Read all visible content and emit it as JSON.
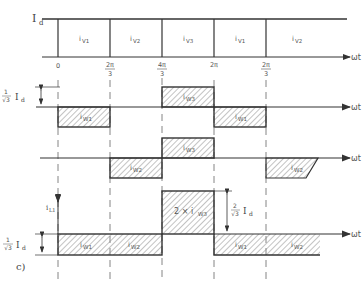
{
  "figure_label": "c)",
  "colors": {
    "line": "#333333",
    "hatch": "#777777",
    "dash": "#666666",
    "text": "#444444"
  },
  "top_plot": {
    "y_label_main": "I",
    "y_label_sub": "d",
    "axis_label": "ωt",
    "segments": [
      {
        "name": "v1",
        "label": "i",
        "sub": "V1"
      },
      {
        "name": "v2",
        "label": "i",
        "sub": "V2"
      },
      {
        "name": "v3",
        "label": "i",
        "sub": "V3"
      },
      {
        "name": "v1b",
        "label": "i",
        "sub": "V1"
      },
      {
        "name": "v2b",
        "label": "i",
        "sub": "V2"
      }
    ],
    "ticks": [
      {
        "num": "0",
        "den": ""
      },
      {
        "num": "2π",
        "den": "3"
      },
      {
        "num": "4π",
        "den": "3"
      },
      {
        "num": "2π",
        "den": ""
      },
      {
        "num": "2π",
        "den": "3"
      }
    ]
  },
  "plot_w1": {
    "axis_label": "ωt",
    "amp_num": "1",
    "amp_den": "√3",
    "amp_unit": "I",
    "amp_sub": "d",
    "blocks": [
      {
        "label": "i",
        "sub": "W1"
      },
      {
        "label": "i",
        "sub": "W3"
      },
      {
        "label": "i",
        "sub": "W1"
      }
    ]
  },
  "plot_w2": {
    "axis_label": "ωt",
    "blocks": [
      {
        "label": "i",
        "sub": "W3"
      },
      {
        "label": "i",
        "sub": "W2"
      },
      {
        "label": "i",
        "sub": "W2"
      }
    ]
  },
  "plot_l1": {
    "y_label_main": "i",
    "y_label_sub": "L1",
    "axis_label": "ωt",
    "amp_num": "1",
    "amp_den": "√3",
    "amp_unit": "I",
    "amp_sub": "d",
    "peak_num": "2",
    "peak_den": "√3",
    "peak_unit": "I",
    "peak_sub": "d",
    "peak_block": "2 × i",
    "peak_block_sub": "W3",
    "blocks": [
      {
        "label": "i",
        "sub": "W1"
      },
      {
        "label": "i",
        "sub": "W2"
      },
      {
        "label": "i",
        "sub": "W1"
      },
      {
        "label": "i",
        "sub": "W2"
      }
    ]
  }
}
